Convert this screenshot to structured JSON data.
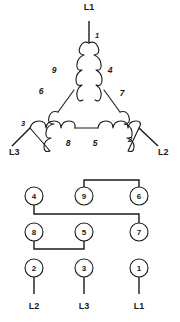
{
  "figure": {
    "title": "",
    "delta_diagram": {
      "name": "delta-winding-diagram",
      "line_labels": [
        {
          "id": "l1-top",
          "text": "L1",
          "x": 89,
          "y": 10
        },
        {
          "id": "l3-left",
          "text": "L3",
          "x": 9,
          "y": 151
        },
        {
          "id": "l2-right",
          "text": "L2",
          "x": 160,
          "y": 151
        }
      ],
      "terminal_numbers": [
        {
          "id": "t1",
          "text": "1",
          "x": 95,
          "y": 36
        },
        {
          "id": "t3",
          "text": "3",
          "x": 24,
          "y": 127
        },
        {
          "id": "t2",
          "text": "2",
          "x": 129,
          "y": 141
        }
      ],
      "coil_labels": [
        {
          "id": "c9",
          "text": "9",
          "x": 54,
          "y": 70
        },
        {
          "id": "c4",
          "text": "4",
          "x": 108,
          "y": 70
        },
        {
          "id": "c6",
          "text": "6",
          "x": 42,
          "y": 90
        },
        {
          "id": "c7",
          "text": "7",
          "x": 119,
          "y": 92
        },
        {
          "id": "c8",
          "text": "8",
          "x": 68,
          "y": 144
        },
        {
          "id": "c5",
          "text": "5",
          "x": 95,
          "y": 144
        }
      ]
    },
    "terminal_board": {
      "name": "terminal-board-diagram",
      "rows": [
        {
          "row": 1,
          "terminals": [
            {
              "label": "4",
              "cx": 34,
              "cy": 196
            },
            {
              "label": "9",
              "cx": 84,
              "cy": 196
            },
            {
              "label": "6",
              "cx": 139,
              "cy": 196
            }
          ]
        },
        {
          "row": 2,
          "terminals": [
            {
              "label": "8",
              "cx": 34,
              "cy": 232
            },
            {
              "label": "5",
              "cx": 84,
              "cy": 232
            },
            {
              "label": "7",
              "cx": 139,
              "cy": 232
            }
          ]
        },
        {
          "row": 3,
          "terminals": [
            {
              "label": "2",
              "cx": 34,
              "cy": 268
            },
            {
              "label": "3",
              "cx": 84,
              "cy": 268
            },
            {
              "label": "1",
              "cx": 139,
              "cy": 268
            }
          ]
        }
      ],
      "jumpers": [
        {
          "id": "jumper-9-6",
          "connects": [
            "9",
            "6"
          ]
        },
        {
          "id": "jumper-4-7",
          "connects": [
            "4",
            "7"
          ]
        },
        {
          "id": "jumper-8-5",
          "connects": [
            "8",
            "5"
          ]
        }
      ],
      "line_leads": [
        {
          "id": "lead-l2",
          "text": "L2",
          "terminal": "2",
          "x": 34,
          "y": 305
        },
        {
          "id": "lead-l3",
          "text": "L3",
          "terminal": "3",
          "x": 84,
          "y": 305
        },
        {
          "id": "lead-l1",
          "text": "L1",
          "terminal": "1",
          "x": 139,
          "y": 305
        }
      ]
    },
    "colors": {
      "ink": "#1a1a1a",
      "background": "#ffffff"
    }
  }
}
